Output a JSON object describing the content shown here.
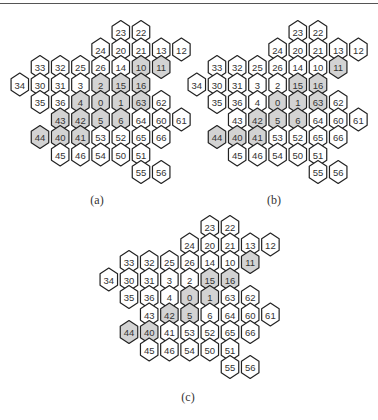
{
  "figure": {
    "grid": {
      "rows": [
        {
          "y": 0,
          "start_x": 4,
          "cells": [
            "23",
            "22"
          ]
        },
        {
          "y": 1,
          "start_x": 3,
          "cells": [
            "24",
            "20",
            "21",
            "13",
            "12"
          ]
        },
        {
          "y": 2,
          "start_x": 0,
          "cells": [
            "33",
            "32",
            "25",
            "26",
            "14",
            "10",
            "11"
          ]
        },
        {
          "y": 3,
          "start_x": -1,
          "cells": [
            "34",
            "30",
            "31",
            "3",
            "2",
            "15",
            "16"
          ]
        },
        {
          "y": 4,
          "start_x": 0,
          "cells": [
            "35",
            "36",
            "4",
            "0",
            "1",
            "63",
            "62"
          ]
        },
        {
          "y": 5,
          "start_x": 1,
          "cells": [
            "43",
            "42",
            "5",
            "6",
            "64",
            "60",
            "61"
          ]
        },
        {
          "y": 6,
          "start_x": 0,
          "cells": [
            "44",
            "40",
            "41",
            "53",
            "52",
            "65",
            "66"
          ]
        },
        {
          "y": 7,
          "start_x": 1,
          "cells": [
            "45",
            "46",
            "54",
            "50",
            "51"
          ]
        },
        {
          "y": 8,
          "start_x": 5,
          "cells": [
            "55",
            "56"
          ]
        }
      ]
    },
    "colors": {
      "shaded_fill": "#d3d3d3",
      "unshaded_fill": "#ffffff",
      "stroke": "#222222"
    },
    "panels": [
      {
        "id": "a",
        "caption": "(a)",
        "origin": {
          "x": 40,
          "y": 32
        },
        "caption_pos": {
          "x": 97,
          "y": 193
        },
        "shaded": [
          "10",
          "11",
          "2",
          "15",
          "16",
          "4",
          "0",
          "1",
          "63",
          "43",
          "42",
          "5",
          "6",
          "44",
          "40",
          "41"
        ]
      },
      {
        "id": "b",
        "caption": "(b)",
        "origin": {
          "x": 217,
          "y": 32
        },
        "caption_pos": {
          "x": 274,
          "y": 193
        },
        "shaded": [
          "11",
          "15",
          "16",
          "0",
          "1",
          "63",
          "42",
          "5",
          "6",
          "44",
          "40",
          "41"
        ]
      },
      {
        "id": "c",
        "caption": "(c)",
        "origin": {
          "x": 129,
          "y": 227
        },
        "caption_pos": {
          "x": 188,
          "y": 390
        },
        "shaded": [
          "11",
          "15",
          "16",
          "0",
          "1",
          "42",
          "5",
          "44",
          "40"
        ]
      }
    ]
  }
}
